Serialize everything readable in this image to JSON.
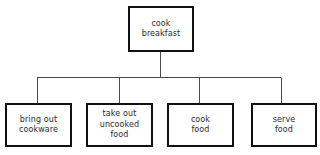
{
  "diagram": {
    "type": "tree",
    "background_color": "#ffffff",
    "box_border_color": "#111111",
    "connector_color": "#4a4a4a",
    "text_color": "#2b2b2b",
    "root": {
      "id": "root",
      "label": "cook\nbreakfast"
    },
    "children": [
      {
        "id": "child-0",
        "label": "bring out\ncookware"
      },
      {
        "id": "child-1",
        "label": "take out\nuncooked\nfood"
      },
      {
        "id": "child-2",
        "label": "cook\nfood"
      },
      {
        "id": "child-3",
        "label": "serve\nfood"
      }
    ]
  }
}
